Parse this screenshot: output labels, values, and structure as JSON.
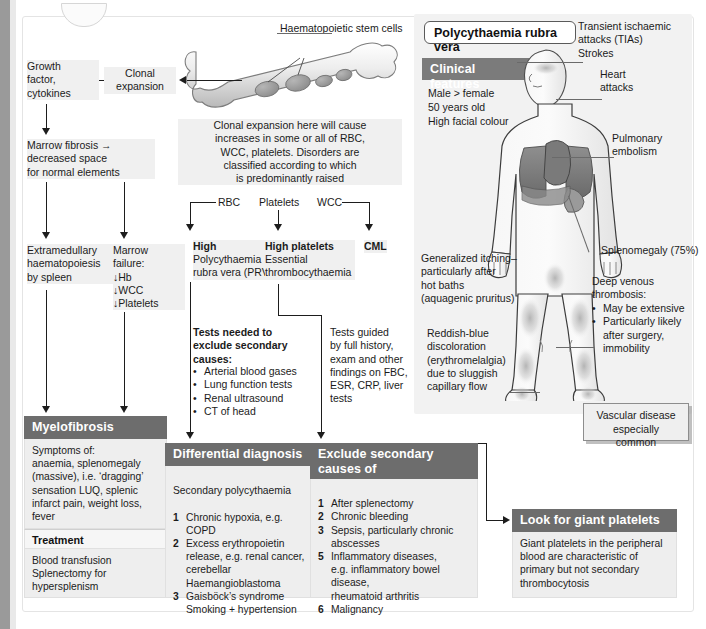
{
  "figure": {
    "left_flow": {
      "stem_cells_label": "Haematopoietic stem cells",
      "clonal_expansion": "Clonal\nexpansion",
      "growth_factor": "Growth\nfactor,\ncytokines",
      "marrow_fibrosis": "Marrow fibrosis →\ndecreased space\nfor normal elements",
      "bone_caption": "Clonal expansion here will cause\nincreases in some or all of RBC,\nWCC, platelets. Disorders are\nclassified according to which\nis predominantly raised",
      "extramedullary": "Extramedullary\nhaematopoiesis\nby spleen",
      "marrow_failure": "Marrow\nfailure:\n↓Hb\n↓WCC\n↓Platelets",
      "lineage_rbc": "RBC",
      "lineage_platelets": "Platelets",
      "lineage_wcc": "WCC",
      "high_haemoglobin_title": "High haemoglobin",
      "high_haemoglobin_body": "Polycythaemia\nrubra vera (PRV)",
      "high_platelets_title": "High platelets",
      "high_platelets_body": "Essential\nthrombocythaemia",
      "cml": "CML",
      "tests_needed_title": "Tests needed to\nexclude secondary\ncauses:",
      "tests_needed_items": [
        "Arterial blood gases",
        "Lung function tests",
        "Renal ultrasound",
        "CT of head"
      ],
      "tests_guided": "Tests guided\nby full history,\nexam and other\nfindings on FBC,\nESR, CRP, liver\ntests"
    },
    "myelofibrosis": {
      "header": "Myelofibrosis",
      "symptoms": "Symptoms of:\nanaemia, splenomegaly\n(massive), i.e. ‘dragging’\nsensation LUQ, splenic\ninfarct pain, weight loss,\nfever",
      "treatment_header": "Treatment",
      "treatment_body": "Blood transfusion\nSplenectomy for\nhypersplenism"
    },
    "differential_diagnosis": {
      "header": "Differential diagnosis",
      "intro": "Secondary polycythaemia",
      "items": [
        {
          "n": "1",
          "text": "Chronic hypoxia, e.g. COPD"
        },
        {
          "n": "2",
          "text": "Excess erythropoietin\nrelease, e.g. renal cancer,\ncerebellar\nHaemangioblastoma"
        },
        {
          "n": "3",
          "text": "Gaisböck’s syndrome\nSmoking + hypertension"
        }
      ]
    },
    "exclude_secondary": {
      "header": "Exclude secondary causes\nof thrombocytosis",
      "items": [
        {
          "n": "1",
          "text": "After splenectomy"
        },
        {
          "n": "2",
          "text": "Chronic bleeding"
        },
        {
          "n": "3",
          "text": "Sepsis, particularly chronic\nabscesses"
        },
        {
          "n": "5",
          "text": "Inflammatory diseases,\ne.g. inflammatory bowel disease,\nrheumatoid arthritis"
        },
        {
          "n": "6",
          "text": "Malignancy"
        }
      ]
    },
    "giant_platelets": {
      "header": "Look for giant platelets",
      "body": "Giant platelets in the peripheral\nblood are characteristic of\nprimary but not secondary\nthrombocytosis"
    },
    "right_panel": {
      "title": "Polycythaemia rubra vera",
      "clinical_features_header": "Clinical features",
      "clinical_features_body": "Male > female\n50 years old\nHigh facial colour",
      "tia": "Transient ischaemic\nattacks (TIAs)\nStrokes",
      "heart_attacks": "Heart\nattacks",
      "pulmonary_embolism": "Pulmonary\nembolism",
      "splenomegaly": "Splenomegaly (75%)",
      "itching": "Generalized itching–\nparticularly after\nhot baths\n(aquagenic pruritus)",
      "dvt_title": "Deep venous\nthrombosis:",
      "dvt_items": [
        "May be extensive",
        "Particularly likely\n  after surgery,\n  immobility"
      ],
      "erythromelalgia": "Reddish-blue\ndiscoloration\n(erythromelalgia)\ndue to sluggish\ncapillary flow",
      "vascular_disease": "Vascular disease\nespecially common"
    }
  },
  "colors": {
    "header_bar": "#6d6d6d",
    "box_body": "#eeeeee",
    "panel_bg": "#f2f2f2",
    "line": "#1d1d1d",
    "gutter": "#9a9a9a"
  }
}
